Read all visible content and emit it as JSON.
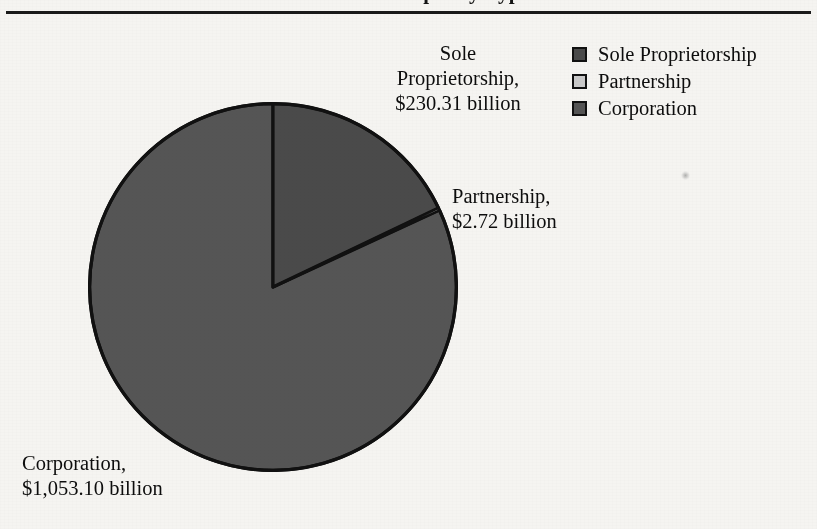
{
  "page": {
    "background_color": "#f5f4f1",
    "ink_color": "#0d0d0d"
  },
  "header": {
    "title_fragment": "Business Receipts by Type",
    "rule_color": "#1a1a1a"
  },
  "legend": {
    "items": [
      {
        "label": "Sole Proprietorship",
        "color": "#4a4a4a"
      },
      {
        "label": "Partnership",
        "color": "#c9c9c9"
      },
      {
        "label": "Corporation",
        "color": "#555555"
      }
    ]
  },
  "callouts": {
    "sole": "Sole\nProprietorship,\n$230.31 billion",
    "partnership": "Partnership,\n$2.72 billion",
    "corporation": "Corporation,\n$1,053.10 billion"
  },
  "chart_data": {
    "type": "pie",
    "title": "Business Receipts by Type",
    "unit": "billion dollars",
    "categories": [
      "Sole Proprietorship",
      "Partnership",
      "Corporation"
    ],
    "values": [
      230.31,
      2.72,
      1053.1
    ],
    "value_labels": [
      "$230.31 billion",
      "$2.72 billion",
      "$1,053.10 billion"
    ],
    "colors": [
      "#4a4a4a",
      "#c9c9c9",
      "#555555"
    ],
    "total": 1286.13,
    "percentages": [
      17.9,
      0.21,
      81.88
    ],
    "start_angle_deg": 0,
    "direction": "clockwise",
    "legend_position": "top-right",
    "grid": false,
    "geometry": {
      "center_x": 273,
      "center_y": 287,
      "radius": 185
    }
  }
}
